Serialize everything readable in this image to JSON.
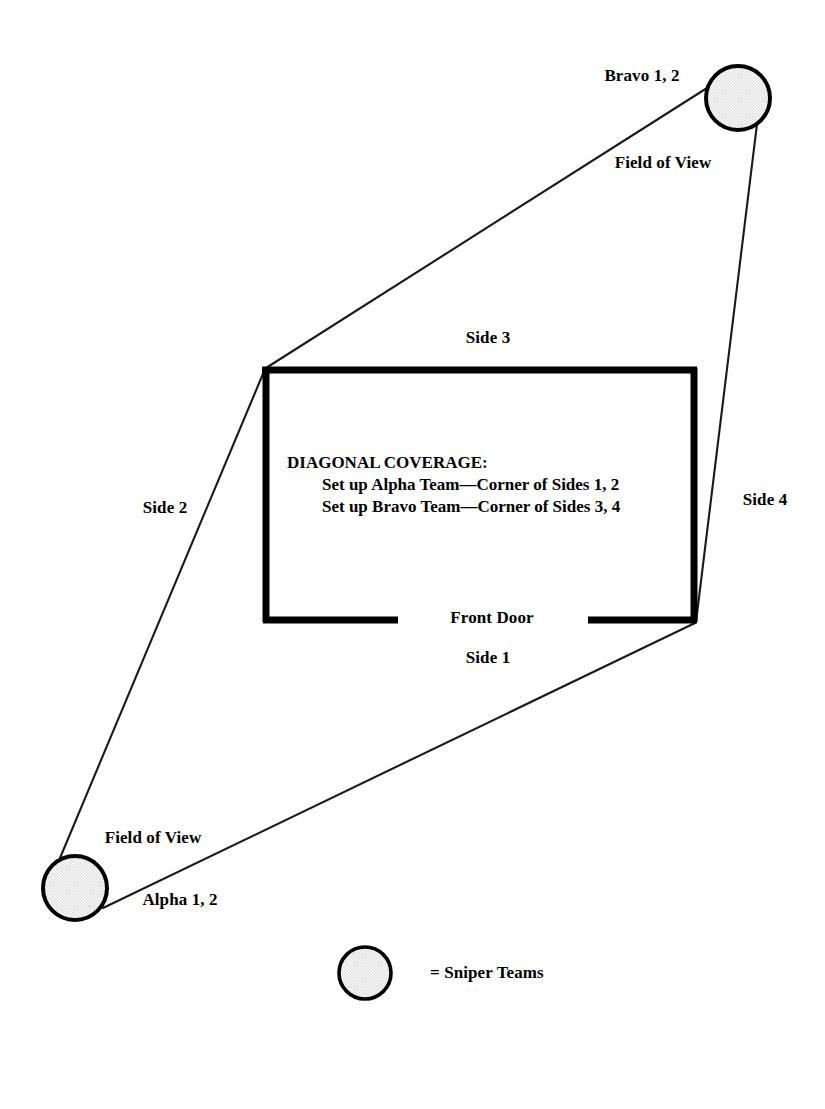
{
  "diagram": {
    "colors": {
      "ink": "#000000",
      "background": "#ffffff",
      "circle_fill": "#ededed",
      "wall": "#000000",
      "sight_line": "#1a1a1a"
    },
    "instructions": {
      "heading": "DIAGONAL COVERAGE:",
      "line_1": "Set up Alpha Team—Corner of Sides 1, 2",
      "line_2": "Set up Bravo Team—Corner of Sides 3, 4"
    },
    "building": {
      "side_1_label": "Side 1",
      "side_2_label": "Side 2",
      "side_3_label": "Side 3",
      "side_4_label": "Side 4",
      "front_door_label": "Front Door"
    },
    "teams": [
      {
        "id": "bravo",
        "label": "Bravo 1, 2",
        "field_of_view_label": "Field of View",
        "marker": "sniper-team-circle"
      },
      {
        "id": "alpha",
        "label": "Alpha 1, 2",
        "field_of_view_label": "Field of View",
        "marker": "sniper-team-circle"
      }
    ],
    "legend": {
      "symbol": "sniper-team-circle",
      "text": "= Sniper Teams"
    }
  }
}
